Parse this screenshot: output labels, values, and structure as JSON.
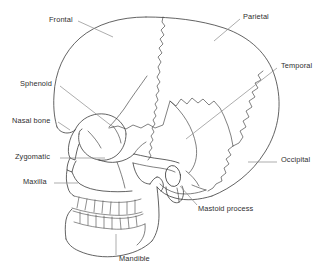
{
  "figure": {
    "kind": "anatomical-line-diagram",
    "width": 321,
    "height": 277,
    "background_color": "#ffffff",
    "line_color": "#3b3b3b",
    "leader_color": "#8a8a8a",
    "text_color": "#2e2e2e"
  },
  "labels": [
    {
      "id": "frontal",
      "text": "Frontal",
      "align": "left",
      "x": 49,
      "y": 19
    },
    {
      "id": "parietal",
      "text": "Parietal",
      "align": "left",
      "x": 243,
      "y": 16
    },
    {
      "id": "temporal",
      "text": "Temporal",
      "align": "left",
      "x": 279,
      "y": 65
    },
    {
      "id": "sphenoid",
      "text": "Sphenoid",
      "align": "right",
      "x": 22,
      "y": 83
    },
    {
      "id": "nasal-bone",
      "text": "Nasal bone",
      "align": "right",
      "x": 14,
      "y": 120
    },
    {
      "id": "zygomatic",
      "text": "Zygomatic",
      "align": "right",
      "x": 16,
      "y": 156
    },
    {
      "id": "maxilla",
      "text": "Maxilla",
      "align": "right",
      "x": 26,
      "y": 181
    },
    {
      "id": "occipital",
      "text": "Occipital",
      "align": "left",
      "x": 279,
      "y": 159
    },
    {
      "id": "mastoid-process",
      "text": "Mastoid process",
      "align": "left",
      "x": 196,
      "y": 208
    },
    {
      "id": "mandible",
      "text": "Mandible",
      "align": "left",
      "x": 117,
      "y": 258
    }
  ]
}
